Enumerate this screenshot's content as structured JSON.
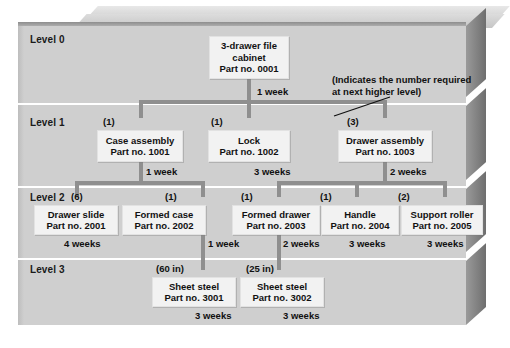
{
  "diagram": {
    "levels": [
      {
        "id": "level-0",
        "label": "Level 0"
      },
      {
        "id": "level-1",
        "label": "Level 1"
      },
      {
        "id": "level-2",
        "label": "Level 2"
      },
      {
        "id": "level-3",
        "label": "Level 3"
      }
    ],
    "annotation": {
      "line1": "(Indicates the number required",
      "line2": "at next higher level)"
    },
    "nodes": [
      {
        "id": "n0001",
        "level": 0,
        "name_line1": "3-drawer file",
        "name_line2": "cabinet",
        "part": "Part no. 0001",
        "qty": "",
        "lead_time": "1 week"
      },
      {
        "id": "n1001",
        "level": 1,
        "name_line1": "Case assembly",
        "name_line2": "",
        "part": "Part no. 1001",
        "qty": "(1)",
        "lead_time": "1 week"
      },
      {
        "id": "n1002",
        "level": 1,
        "name_line1": "Lock",
        "name_line2": "",
        "part": "Part no. 1002",
        "qty": "(1)",
        "lead_time": "3 weeks"
      },
      {
        "id": "n1003",
        "level": 1,
        "name_line1": "Drawer assembly",
        "name_line2": "",
        "part": "Part no. 1003",
        "qty": "(3)",
        "lead_time": "2 weeks"
      },
      {
        "id": "n2001",
        "level": 2,
        "name_line1": "Drawer slide",
        "name_line2": "",
        "part": "Part no. 2001",
        "qty": "(6)",
        "lead_time": "4 weeks"
      },
      {
        "id": "n2002",
        "level": 2,
        "name_line1": "Formed case",
        "name_line2": "",
        "part": "Part no. 2002",
        "qty": "(1)",
        "lead_time": "1 week"
      },
      {
        "id": "n2003",
        "level": 2,
        "name_line1": "Formed drawer",
        "name_line2": "",
        "part": "Part no. 2003",
        "qty": "(1)",
        "lead_time": "2 weeks"
      },
      {
        "id": "n2004",
        "level": 2,
        "name_line1": "Handle",
        "name_line2": "",
        "part": "Part no. 2004",
        "qty": "(1)",
        "lead_time": "3 weeks"
      },
      {
        "id": "n2005",
        "level": 2,
        "name_line1": "Support roller",
        "name_line2": "",
        "part": "Part no. 2005",
        "qty": "(2)",
        "lead_time": "3 weeks"
      },
      {
        "id": "n3001",
        "level": 3,
        "name_line1": "Sheet steel",
        "name_line2": "",
        "part": "Part no. 3001",
        "qty": "(60 in)",
        "lead_time": "3 weeks"
      },
      {
        "id": "n3002",
        "level": 3,
        "name_line1": "Sheet steel",
        "name_line2": "",
        "part": "Part no. 3002",
        "qty": "(25 in)",
        "lead_time": "3 weeks"
      }
    ],
    "colors": {
      "panel": "#cdcdcd",
      "node_fill": "#f2f2f2",
      "connector": "#8f8f8f",
      "text": "#111111"
    }
  }
}
